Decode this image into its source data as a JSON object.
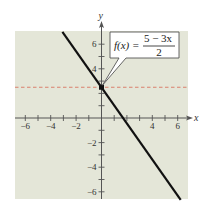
{
  "chart_data": {
    "type": "line",
    "title": "",
    "xlabel": "x",
    "ylabel": "y",
    "xlim": [
      -7,
      7
    ],
    "ylim": [
      -7,
      7
    ],
    "grid": false,
    "x_ticks": [
      -6,
      -4,
      -2,
      4,
      6
    ],
    "x_tick_labels": [
      "−6",
      "−4",
      "−2",
      "4",
      "6"
    ],
    "x_minor_ticks": [
      -6,
      -5,
      -4,
      -3,
      -2,
      -1,
      1,
      2,
      3,
      4,
      5,
      6
    ],
    "y_ticks": [
      6,
      4,
      -2,
      -4,
      -6
    ],
    "y_tick_labels": [
      "6",
      "4",
      "−2",
      "−4",
      "−6"
    ],
    "y_minor_ticks": [
      -6,
      -5,
      -4,
      -3,
      -2,
      -1,
      1,
      2,
      3,
      4,
      5,
      6
    ],
    "series": [
      {
        "name": "f(x) = (5 − 3x)/2",
        "kind": "line",
        "slope": -1.5,
        "intercept": 2.5,
        "x": [
          -3,
          6
        ],
        "y": [
          7,
          -6.5
        ],
        "color": "#111111"
      },
      {
        "name": "y = 5/2",
        "kind": "horizontal-dashed",
        "y": 2.5,
        "color": "#d9806e"
      }
    ],
    "points": [
      {
        "x": 0,
        "y": 2.5,
        "label": "y-intercept"
      }
    ],
    "annotation": {
      "lhs": "f(x) =",
      "numerator": "5 − 3x",
      "denominator": "2",
      "points_to": [
        0,
        2.5
      ]
    },
    "colors": {
      "plot_background": "#e4e6d8",
      "axis": "#555555",
      "line": "#111111",
      "dashed": "#d9806e",
      "callout_fill": "#ffffff",
      "callout_stroke": "#555555"
    }
  }
}
